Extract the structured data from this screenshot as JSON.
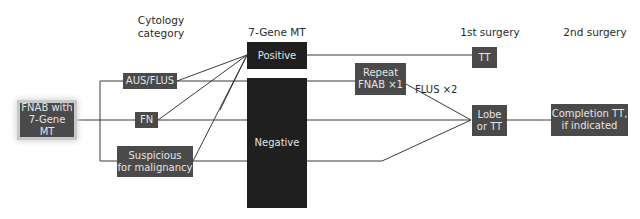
{
  "headers": {
    "cytology": "Cytology\ncategory",
    "cytology_line1": "Cytology",
    "cytology_line2": "category",
    "gene_mt": "7-Gene MT",
    "first_surgery": "1st surgery",
    "second_surgery": "2nd surgery"
  },
  "nodes": {
    "start_line1": "FNAB with",
    "start_line2": "7-Gene MT",
    "aus_flus": "AUS/FLUS",
    "fn": "FN",
    "suspicious_line1": "Suspicious",
    "suspicious_line2": "for malignancy",
    "positive": "Positive",
    "negative": "Negative",
    "repeat_line1": "Repeat",
    "repeat_line2": "FNAB ×1",
    "tt": "TT",
    "lobe_line1": "Lobe",
    "lobe_line2": "or TT",
    "completion_line1": "Completion TT,",
    "completion_line2": "if indicated"
  },
  "edge_labels": {
    "flus_x2": "FLUS ×2"
  },
  "colors": {
    "node_fill": "#4a4a4a",
    "node_dark_fill": "#1f1f1f",
    "node_text": "#e4e4e4",
    "line": "#3a3a3a",
    "header_text": "#2a2a2a"
  }
}
